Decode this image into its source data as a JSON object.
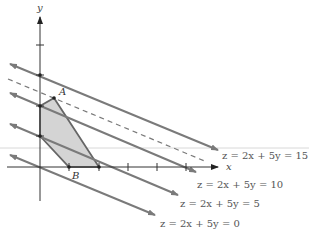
{
  "figure": {
    "axes": {
      "x_label": "x",
      "y_label": "y"
    },
    "points": {
      "A": "A",
      "B": "B"
    },
    "level_lines": [
      {
        "label": "z = 2x + 5y = 15",
        "style": "solid"
      },
      {
        "label": "",
        "style": "dashed"
      },
      {
        "label": "z = 2x + 5y = 10",
        "style": "solid"
      },
      {
        "label": "z = 2x + 5y = 5",
        "style": "solid"
      },
      {
        "label": "z = 2x + 5y = 0",
        "style": "solid"
      }
    ],
    "colors": {
      "feasible_region": "#d4d4d4",
      "lines": "#7a7a7a",
      "axes": "#333333"
    }
  }
}
